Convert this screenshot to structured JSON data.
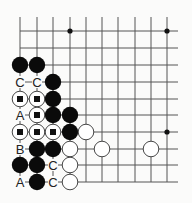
{
  "diagram": {
    "type": "go-board-problem",
    "grid": {
      "columns": 10,
      "rows": 10,
      "col_x": [
        20,
        37,
        53,
        70,
        86,
        102,
        118,
        135,
        151,
        167
      ],
      "row_y": [
        31,
        48,
        65,
        82,
        99,
        115,
        132,
        149,
        165,
        182
      ],
      "open_right_to": 178,
      "open_top_from": 17,
      "line_color": "#555555"
    },
    "star_points": [
      {
        "col": 3,
        "row": 0
      },
      {
        "col": 9,
        "row": 0
      },
      {
        "col": 9,
        "row": 6
      }
    ],
    "stones": [
      {
        "col": 0,
        "row": 2,
        "color": "black"
      },
      {
        "col": 1,
        "row": 2,
        "color": "black"
      },
      {
        "col": 2,
        "row": 3,
        "color": "black"
      },
      {
        "col": 0,
        "row": 4,
        "color": "white",
        "marker": "square"
      },
      {
        "col": 1,
        "row": 4,
        "color": "white",
        "marker": "square"
      },
      {
        "col": 2,
        "row": 4,
        "color": "black"
      },
      {
        "col": 1,
        "row": 5,
        "color": "white",
        "marker": "square"
      },
      {
        "col": 2,
        "row": 5,
        "color": "black"
      },
      {
        "col": 3,
        "row": 5,
        "color": "black"
      },
      {
        "col": 0,
        "row": 6,
        "color": "white",
        "marker": "square"
      },
      {
        "col": 1,
        "row": 6,
        "color": "white",
        "marker": "square"
      },
      {
        "col": 2,
        "row": 6,
        "color": "white",
        "marker": "square"
      },
      {
        "col": 3,
        "row": 6,
        "color": "black"
      },
      {
        "col": 4,
        "row": 6,
        "color": "white"
      },
      {
        "col": 1,
        "row": 7,
        "color": "black"
      },
      {
        "col": 2,
        "row": 7,
        "color": "black"
      },
      {
        "col": 3,
        "row": 7,
        "color": "white"
      },
      {
        "col": 5,
        "row": 7,
        "color": "white"
      },
      {
        "col": 8,
        "row": 7,
        "color": "white"
      },
      {
        "col": 0,
        "row": 8,
        "color": "black"
      },
      {
        "col": 1,
        "row": 8,
        "color": "black"
      },
      {
        "col": 3,
        "row": 8,
        "color": "white"
      },
      {
        "col": 1,
        "row": 9,
        "color": "black"
      },
      {
        "col": 3,
        "row": 9,
        "color": "white"
      }
    ],
    "labels": [
      {
        "col": 0,
        "row": 3,
        "text": "C"
      },
      {
        "col": 1,
        "row": 3,
        "text": "C"
      },
      {
        "col": 0,
        "row": 5,
        "text": "A"
      },
      {
        "col": 0,
        "row": 7,
        "text": "B"
      },
      {
        "col": 2,
        "row": 8,
        "text": "C"
      },
      {
        "col": 0,
        "row": 9,
        "text": "A"
      },
      {
        "col": 2,
        "row": 9,
        "text": "C"
      }
    ],
    "colors": {
      "background": "#fbfbfa",
      "black_stone": "#0a0a0a",
      "white_stone_fill": "#ffffff",
      "white_stone_stroke": "#333333",
      "marker": "#111111",
      "label": "#222222"
    }
  }
}
